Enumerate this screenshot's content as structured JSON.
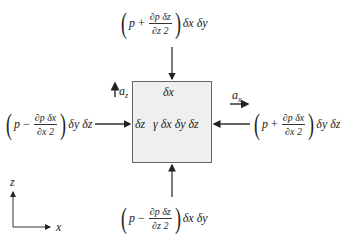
{
  "diagram": {
    "title": "",
    "element": {
      "top_label": "δx",
      "left_label": "δz",
      "weight_label": "γ δx δy δz"
    },
    "forces": {
      "top": {
        "p": "p",
        "op": "+",
        "num": "∂p δz",
        "den": "∂z 2",
        "tail": "δx δy"
      },
      "bottom": {
        "p": "p",
        "op": "−",
        "num": "∂p δz",
        "den": "∂z 2",
        "tail": "δx δy"
      },
      "left": {
        "p": "p",
        "op": "−",
        "num": "∂p δx",
        "den": "∂x 2",
        "tail": "δy δz"
      },
      "right": {
        "p": "p",
        "op": "+",
        "num": "∂p δx",
        "den": "∂x 2",
        "tail": "δy δz"
      }
    },
    "accelerations": {
      "az": "a",
      "az_sub": "z",
      "ax": "a",
      "ax_sub": "x"
    },
    "axes": {
      "vertical": "z",
      "horizontal": "x"
    },
    "colors": {
      "box_fill": "#efefef",
      "line": "#333333"
    }
  }
}
